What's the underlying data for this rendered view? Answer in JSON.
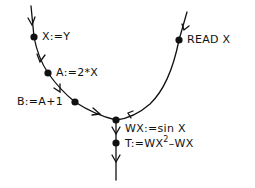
{
  "diagram": {
    "type": "data-flow graph",
    "colors": {
      "ink": "#111111",
      "background": "#ffffff"
    },
    "nodes": [
      {
        "id": "n1",
        "label": "X:=Y"
      },
      {
        "id": "n2",
        "label": "A:=2*X"
      },
      {
        "id": "n3",
        "label": "B:=A+1"
      },
      {
        "id": "n4",
        "label": "READ X"
      },
      {
        "id": "n5",
        "label": "WX:=sin X"
      },
      {
        "id": "n6",
        "label_base": "T:=WX",
        "label_sup": "2",
        "label_tail": "–WX"
      }
    ],
    "edges": [
      {
        "from": "entry-left",
        "to": "n1"
      },
      {
        "from": "n1",
        "to": "n2"
      },
      {
        "from": "n2",
        "to": "n3"
      },
      {
        "from": "n3",
        "to": "n5"
      },
      {
        "from": "entry-right",
        "to": "n4"
      },
      {
        "from": "n4",
        "to": "n5"
      },
      {
        "from": "n5",
        "to": "n6"
      },
      {
        "from": "n6",
        "to": "exit"
      }
    ]
  }
}
